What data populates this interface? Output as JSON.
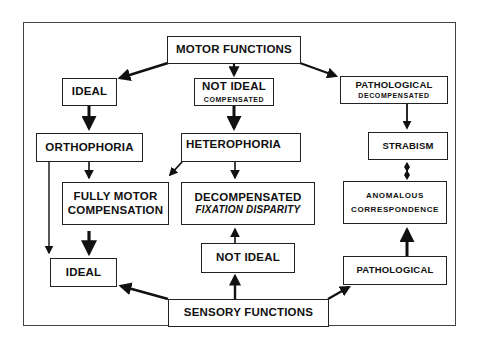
{
  "diagram": {
    "title": "MOTOR FUNCTIONS",
    "bottom_title": "SENSORY FUNCTIONS",
    "nodes": {
      "motor_functions": {
        "label": "MOTOR FUNCTIONS"
      },
      "ideal_top": {
        "label": "IDEAL"
      },
      "not_ideal_compensated": {
        "label": "NOT IDEAL",
        "sub": "COMPENSATED"
      },
      "pathological_decompensated": {
        "label": "PATHOLOGICAL",
        "sub": "DECOMPENSATED"
      },
      "orthophoria": {
        "label": "ORTHOPHORIA"
      },
      "heterophoria": {
        "label": "HETEROPHORIA"
      },
      "strabism": {
        "label": "STRABISM"
      },
      "fully_motor_compensation": {
        "line1": "FULLY MOTOR",
        "line2": "COMPENSATION"
      },
      "decompensated_fixation_disparity": {
        "line1": "DECOMPENSATED",
        "line2": "FIXATION DISPARITY"
      },
      "anomalous_correspondence": {
        "line1": "ANOMALOUS",
        "line2": "CORRESPONDENCE"
      },
      "ideal_bottom": {
        "label": "IDEAL"
      },
      "not_ideal_bottom": {
        "label": "NOT IDEAL"
      },
      "pathological_bottom": {
        "label": "PATHOLOGICAL"
      },
      "sensory_functions": {
        "label": "SENSORY FUNCTIONS"
      }
    },
    "edges": [
      {
        "from": "MOTOR FUNCTIONS",
        "to": "IDEAL"
      },
      {
        "from": "MOTOR FUNCTIONS",
        "to": "NOT IDEAL COMPENSATED"
      },
      {
        "from": "MOTOR FUNCTIONS",
        "to": "PATHOLOGICAL DECOMPENSATED"
      },
      {
        "from": "IDEAL",
        "to": "ORTHOPHORIA"
      },
      {
        "from": "NOT IDEAL COMPENSATED",
        "to": "HETEROPHORIA"
      },
      {
        "from": "PATHOLOGICAL DECOMPENSATED",
        "to": "STRABISM"
      },
      {
        "from": "ORTHOPHORIA",
        "to": "FULLY MOTOR COMPENSATION"
      },
      {
        "from": "ORTHOPHORIA",
        "to": "IDEAL (sensory)"
      },
      {
        "from": "HETEROPHORIA",
        "to": "FULLY MOTOR COMPENSATION"
      },
      {
        "from": "HETEROPHORIA",
        "to": "DECOMPENSATED FIXATION DISPARITY"
      },
      {
        "from": "STRABISM",
        "to": "ANOMALOUS CORRESPONDENCE",
        "bidirectional": true
      },
      {
        "from": "FULLY MOTOR COMPENSATION",
        "to": "IDEAL (sensory)"
      },
      {
        "from": "NOT IDEAL (sensory)",
        "to": "DECOMPENSATED FIXATION DISPARITY"
      },
      {
        "from": "PATHOLOGICAL (sensory)",
        "to": "ANOMALOUS CORRESPONDENCE"
      },
      {
        "from": "SENSORY FUNCTIONS",
        "to": "IDEAL (sensory)"
      },
      {
        "from": "SENSORY FUNCTIONS",
        "to": "NOT IDEAL (sensory)"
      },
      {
        "from": "SENSORY FUNCTIONS",
        "to": "PATHOLOGICAL (sensory)"
      }
    ],
    "colors": {
      "line": "#111111",
      "background": "#ffffff"
    }
  }
}
